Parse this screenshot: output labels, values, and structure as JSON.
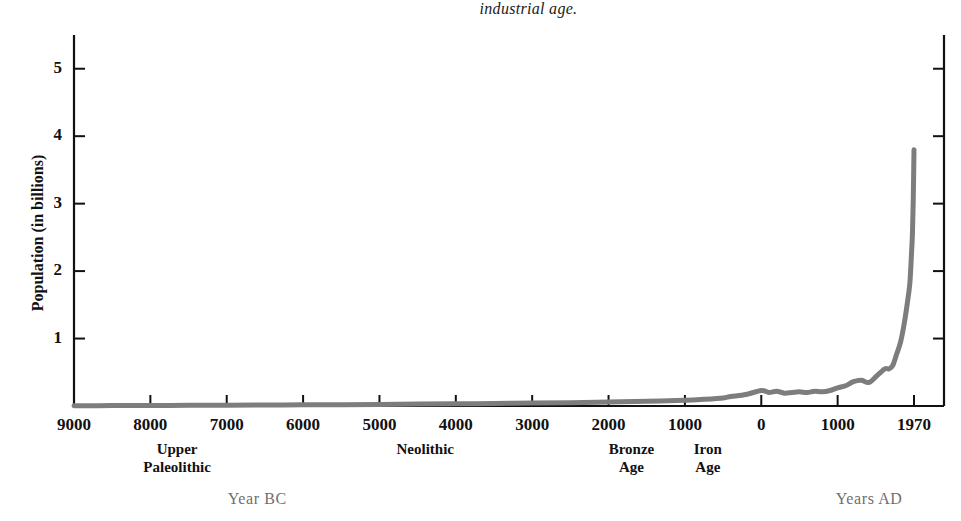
{
  "caption": {
    "text": "industrial age."
  },
  "chart_data": {
    "type": "line",
    "title": "",
    "xlabel": "",
    "ylabel": "Population  (in billions)",
    "ylim": [
      0,
      5.5
    ],
    "yticks": [
      "1",
      "2",
      "3",
      "4",
      "5"
    ],
    "ytick_values": [
      1,
      2,
      3,
      4,
      5
    ],
    "grid": false,
    "legend": null,
    "xticks": [
      "9000",
      "8000",
      "7000",
      "6000",
      "5000",
      "4000",
      "3000",
      "2000",
      "1000",
      "0",
      "1000",
      "1970"
    ],
    "xtick_years": [
      -9000,
      -8000,
      -7000,
      -6000,
      -5000,
      -4000,
      -3000,
      -2000,
      -1000,
      0,
      1000,
      1970
    ],
    "series": [
      {
        "name": "World population",
        "color": "#7d7d7d",
        "x": [
          -9000,
          -8500,
          -8000,
          -7500,
          -7000,
          -6500,
          -6000,
          -5500,
          -5000,
          -4500,
          -4000,
          -3500,
          -3000,
          -2500,
          -2000,
          -1500,
          -1000,
          -750,
          -500,
          -400,
          -200,
          0,
          100,
          200,
          300,
          400,
          500,
          600,
          700,
          800,
          900,
          1000,
          1100,
          1200,
          1300,
          1400,
          1500,
          1600,
          1650,
          1700,
          1750,
          1800,
          1850,
          1900,
          1920,
          1940,
          1950,
          1960,
          1970
        ],
        "y": [
          0.004,
          0.006,
          0.008,
          0.01,
          0.012,
          0.014,
          0.017,
          0.02,
          0.024,
          0.028,
          0.032,
          0.037,
          0.043,
          0.05,
          0.06,
          0.07,
          0.085,
          0.1,
          0.12,
          0.14,
          0.17,
          0.23,
          0.2,
          0.22,
          0.19,
          0.2,
          0.21,
          0.2,
          0.22,
          0.21,
          0.23,
          0.27,
          0.3,
          0.36,
          0.38,
          0.35,
          0.45,
          0.55,
          0.55,
          0.6,
          0.77,
          0.95,
          1.25,
          1.65,
          1.86,
          2.3,
          2.55,
          3.02,
          3.8
        ]
      }
    ],
    "annotations": {
      "eras": [
        {
          "id": "upper-paleolithic",
          "lines": [
            "Upper",
            "Paleolithic"
          ],
          "center_year": -7650
        },
        {
          "id": "neolithic",
          "lines": [
            "Neolithic"
          ],
          "center_year": -4400
        },
        {
          "id": "bronze-age",
          "lines": [
            "Bronze",
            "Age"
          ],
          "center_year": -1700
        },
        {
          "id": "iron-age",
          "lines": [
            "Iron",
            "Age"
          ],
          "center_year": -700
        }
      ],
      "periods": [
        {
          "id": "year-bc",
          "label": "Year BC",
          "center_year": -6600
        },
        {
          "id": "years-ad",
          "label": "Years AD",
          "center_year": 1400
        }
      ]
    }
  }
}
